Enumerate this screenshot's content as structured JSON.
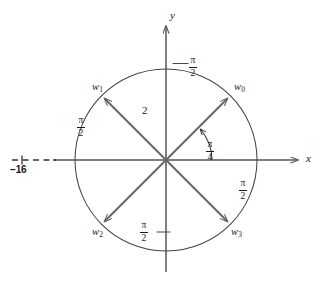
{
  "figure": {
    "background_color": "#ffffff",
    "ink_color": "#1a1a1a",
    "axis_color": "#555555",
    "vector_color": "#666666",
    "arc_color": "#444444",
    "axes": {
      "x_label": "x",
      "y_label": "y"
    },
    "origin": {
      "x": 166,
      "y": 160
    },
    "circle": {
      "radius_px": 91,
      "radius_value": "2"
    },
    "radius_label": "2",
    "point_label": "−16",
    "angle_label": {
      "num": "π",
      "den": "4"
    },
    "arc_label": {
      "num": "π",
      "den": "2"
    },
    "roots": [
      {
        "name": "w",
        "index": "0",
        "angle_deg": 45,
        "label_x": 234,
        "label_y": 82
      },
      {
        "name": "w",
        "index": "1",
        "angle_deg": 135,
        "label_x": 92,
        "label_y": 82
      },
      {
        "name": "w",
        "index": "2",
        "angle_deg": 225,
        "label_x": 92,
        "label_y": 227
      },
      {
        "name": "w",
        "index": "3",
        "angle_deg": 315,
        "label_x": 231,
        "label_y": 227
      }
    ],
    "arc_labels": [
      {
        "position": "top",
        "x": 191,
        "y": 57
      },
      {
        "position": "left",
        "x": 78,
        "y": 117
      },
      {
        "position": "right",
        "x": 240,
        "y": 180
      },
      {
        "position": "bottom",
        "x": 141,
        "y": 222
      }
    ]
  }
}
